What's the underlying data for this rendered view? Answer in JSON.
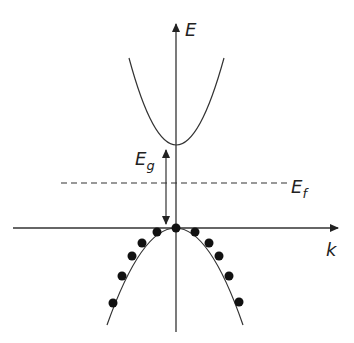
{
  "diagram": {
    "axes": {
      "y_label": "E",
      "x_label": "k"
    },
    "labels": {
      "band_gap": "E",
      "band_gap_sub": "g",
      "fermi": "E",
      "fermi_sub": "f"
    },
    "colors": {
      "line": "#333333",
      "dot": "#111111",
      "background": "#ffffff"
    },
    "conduction_band": {
      "description": "upward parabola, empty",
      "minimum": [
        176,
        145
      ],
      "left_end": [
        129,
        58
      ],
      "right_end": [
        224,
        58
      ]
    },
    "valence_band": {
      "description": "downward parabola filled with electrons",
      "maximum": [
        176,
        228
      ],
      "left_end": [
        107,
        325
      ],
      "right_end": [
        243,
        325
      ],
      "electrons": [
        [
          176,
          228
        ],
        [
          157,
          232
        ],
        [
          195,
          232
        ],
        [
          142,
          243
        ],
        [
          209,
          243
        ],
        [
          132,
          256
        ],
        [
          219,
          256
        ],
        [
          122,
          276
        ],
        [
          229,
          276
        ],
        [
          113,
          303
        ],
        [
          239,
          302
        ]
      ]
    },
    "fermi_level": {
      "y": 183,
      "x_start": 61,
      "x_end": 287,
      "style": "dashed"
    },
    "band_gap_arrow": {
      "x": 166,
      "y_top": 148,
      "y_bottom": 226
    }
  }
}
